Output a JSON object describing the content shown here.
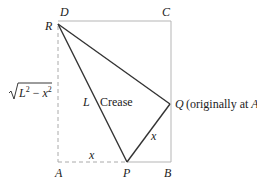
{
  "diagram": {
    "points": {
      "D": {
        "label": "D",
        "x": 58,
        "y": 21
      },
      "C": {
        "label": "C",
        "x": 171,
        "y": 21
      },
      "A": {
        "label": "A",
        "x": 58,
        "y": 162
      },
      "B": {
        "label": "B",
        "x": 171,
        "y": 162
      },
      "R": {
        "label": "R",
        "x": 58,
        "y": 24
      },
      "P": {
        "label": "P",
        "x": 127,
        "y": 162
      },
      "Q": {
        "label": "Q",
        "x": 170,
        "y": 104
      }
    },
    "labels": {
      "D": "D",
      "C": "C",
      "R": "R",
      "A": "A",
      "P": "P",
      "B": "B",
      "Q": "Q",
      "Q_note": "(originally at A)",
      "L": "L",
      "crease": "Crease",
      "x_bottom": "x",
      "x_diag": "x",
      "left_side": "√L² − x²",
      "sqrt_radicand": "L² − x²"
    },
    "colors": {
      "rect_line": "#b5b5b5",
      "dashed_line": "#aaaaaa",
      "fold_line": "#333333",
      "text": "#222222"
    }
  }
}
